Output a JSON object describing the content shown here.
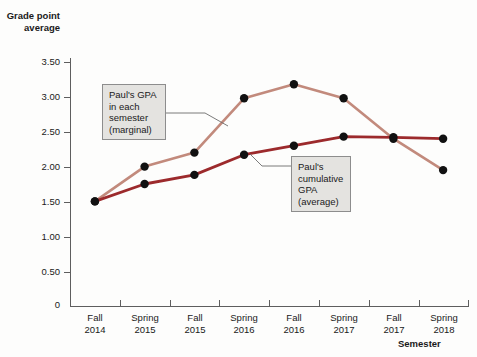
{
  "chart_data": {
    "type": "line",
    "title": "",
    "xlabel": "Semester",
    "ylabel": "Grade point average",
    "categories": [
      "Fall 2014",
      "Spring 2015",
      "Fall 2015",
      "Spring 2016",
      "Fall 2016",
      "Spring 2017",
      "Fall 2017",
      "Spring 2018"
    ],
    "category_lines": [
      [
        "Fall",
        "2014"
      ],
      [
        "Spring",
        "2015"
      ],
      [
        "Fall",
        "2015"
      ],
      [
        "Spring",
        "2016"
      ],
      [
        "Fall",
        "2016"
      ],
      [
        "Spring",
        "2017"
      ],
      [
        "Fall",
        "2017"
      ],
      [
        "Spring",
        "2018"
      ]
    ],
    "ylim": [
      0,
      3.75
    ],
    "yticks": [
      0,
      0.5,
      1.0,
      1.5,
      2.0,
      2.5,
      3.0,
      3.5
    ],
    "ytick_labels": [
      "0",
      "0.50",
      "1.00",
      "1.50",
      "2.00",
      "2.50",
      "3.00",
      "3.50"
    ],
    "grid": false,
    "legend": "none",
    "series": [
      {
        "name": "Paul's GPA in each semester (marginal)",
        "color": "#c28a7c",
        "marker_color": "#111111",
        "values": [
          1.5,
          2.0,
          2.2,
          2.98,
          3.18,
          2.98,
          2.4,
          1.95
        ]
      },
      {
        "name": "Paul's cumulative GPA (average)",
        "color": "#9c2a2c",
        "marker_color": "#111111",
        "values": [
          1.5,
          1.75,
          1.88,
          2.17,
          2.3,
          2.43,
          2.42,
          2.4
        ]
      }
    ],
    "annotations": [
      {
        "id": "marginal-callout",
        "lines": [
          "Paul's GPA",
          "in each",
          "semester",
          "(marginal)"
        ],
        "text": "Paul's GPA in each semester (marginal)",
        "points_to_series": "Paul's GPA in each semester (marginal)"
      },
      {
        "id": "cumulative-callout",
        "lines": [
          "Paul's",
          "cumulative",
          "GPA",
          "(average)"
        ],
        "text": "Paul's cumulative GPA (average)",
        "points_to_series": "Paul's cumulative GPA (average)"
      }
    ]
  },
  "colors": {
    "marginal_line": "#c28a7c",
    "cumulative_line": "#9c2a2c",
    "marker": "#111111",
    "axis": "#5e5e5e",
    "callout_fill": "#e4e3e0",
    "callout_border": "#8d8d8d",
    "background": "#fdfdfc"
  }
}
